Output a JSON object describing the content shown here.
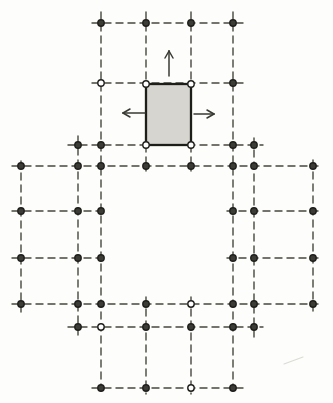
{
  "figure": {
    "kind": "structural-grid-plan",
    "canvas": {
      "width": 333,
      "height": 403,
      "background": "#fdfdfb"
    },
    "palette": {
      "grid_line": "#47473f",
      "node_fill": "#3c3c36",
      "node_open_fill": "#ffffff",
      "node_stroke": "#201f1c",
      "block_fill": "#d6d5d0",
      "block_stroke": "#1d1d1a",
      "arrow": "#3a3a34",
      "smudge": "#dcdbd5"
    },
    "line_style": {
      "width": 1.4,
      "dash": [
        7,
        5
      ]
    },
    "h_lines": [
      {
        "y": 23,
        "x1": 92,
        "x2": 243
      },
      {
        "y": 83,
        "x1": 92,
        "x2": 243
      },
      {
        "y": 145,
        "x1": 68,
        "x2": 263
      },
      {
        "y": 166,
        "x1": 12,
        "x2": 318
      },
      {
        "y": 211,
        "x1": 12,
        "x2": 107
      },
      {
        "y": 211,
        "x1": 227,
        "x2": 318
      },
      {
        "y": 258,
        "x1": 12,
        "x2": 107
      },
      {
        "y": 258,
        "x1": 227,
        "x2": 318
      },
      {
        "y": 304,
        "x1": 12,
        "x2": 318
      },
      {
        "y": 327,
        "x1": 68,
        "x2": 263
      },
      {
        "y": 388,
        "x1": 92,
        "x2": 243
      }
    ],
    "v_lines": [
      {
        "x": 21,
        "y1": 161,
        "y2": 314
      },
      {
        "x": 78,
        "y1": 136,
        "y2": 338
      },
      {
        "x": 101,
        "y1": 12,
        "y2": 394
      },
      {
        "x": 146,
        "y1": 12,
        "y2": 84
      },
      {
        "x": 146,
        "y1": 145,
        "y2": 171
      },
      {
        "x": 146,
        "y1": 297,
        "y2": 394
      },
      {
        "x": 191,
        "y1": 12,
        "y2": 84
      },
      {
        "x": 191,
        "y1": 145,
        "y2": 171
      },
      {
        "x": 191,
        "y1": 297,
        "y2": 394
      },
      {
        "x": 233,
        "y1": 12,
        "y2": 394
      },
      {
        "x": 254,
        "y1": 138,
        "y2": 338
      },
      {
        "x": 313,
        "y1": 160,
        "y2": 312
      }
    ],
    "nodes": [
      {
        "x": 101,
        "y": 23,
        "open": false
      },
      {
        "x": 146,
        "y": 23,
        "open": false
      },
      {
        "x": 191,
        "y": 23,
        "open": false
      },
      {
        "x": 233,
        "y": 23,
        "open": false
      },
      {
        "x": 101,
        "y": 83,
        "open": true
      },
      {
        "x": 233,
        "y": 83,
        "open": false
      },
      {
        "x": 78,
        "y": 145,
        "open": false
      },
      {
        "x": 101,
        "y": 145,
        "open": false
      },
      {
        "x": 233,
        "y": 145,
        "open": false
      },
      {
        "x": 254,
        "y": 145,
        "open": false
      },
      {
        "x": 21,
        "y": 166,
        "open": false
      },
      {
        "x": 78,
        "y": 166,
        "open": false
      },
      {
        "x": 101,
        "y": 166,
        "open": false
      },
      {
        "x": 146,
        "y": 166,
        "open": false
      },
      {
        "x": 191,
        "y": 166,
        "open": false
      },
      {
        "x": 233,
        "y": 166,
        "open": false
      },
      {
        "x": 254,
        "y": 166,
        "open": false
      },
      {
        "x": 313,
        "y": 166,
        "open": false
      },
      {
        "x": 21,
        "y": 211,
        "open": false
      },
      {
        "x": 78,
        "y": 211,
        "open": false
      },
      {
        "x": 101,
        "y": 211,
        "open": false
      },
      {
        "x": 233,
        "y": 211,
        "open": false
      },
      {
        "x": 254,
        "y": 211,
        "open": false
      },
      {
        "x": 313,
        "y": 211,
        "open": false
      },
      {
        "x": 21,
        "y": 258,
        "open": false
      },
      {
        "x": 78,
        "y": 258,
        "open": false
      },
      {
        "x": 101,
        "y": 258,
        "open": false
      },
      {
        "x": 233,
        "y": 258,
        "open": false
      },
      {
        "x": 254,
        "y": 258,
        "open": false
      },
      {
        "x": 313,
        "y": 258,
        "open": false
      },
      {
        "x": 21,
        "y": 304,
        "open": false
      },
      {
        "x": 78,
        "y": 304,
        "open": false
      },
      {
        "x": 101,
        "y": 304,
        "open": false
      },
      {
        "x": 146,
        "y": 304,
        "open": false
      },
      {
        "x": 191,
        "y": 304,
        "open": true
      },
      {
        "x": 233,
        "y": 304,
        "open": false
      },
      {
        "x": 254,
        "y": 304,
        "open": false
      },
      {
        "x": 313,
        "y": 304,
        "open": false
      },
      {
        "x": 78,
        "y": 327,
        "open": false
      },
      {
        "x": 101,
        "y": 327,
        "open": true
      },
      {
        "x": 146,
        "y": 327,
        "open": false
      },
      {
        "x": 191,
        "y": 327,
        "open": false
      },
      {
        "x": 233,
        "y": 327,
        "open": false
      },
      {
        "x": 254,
        "y": 327,
        "open": false
      },
      {
        "x": 101,
        "y": 388,
        "open": false
      },
      {
        "x": 146,
        "y": 388,
        "open": false
      },
      {
        "x": 191,
        "y": 388,
        "open": true
      },
      {
        "x": 233,
        "y": 388,
        "open": false
      }
    ],
    "node_style": {
      "radius": 3.2,
      "ring_width": 1.4
    },
    "block": {
      "x": 146,
      "y": 84,
      "width": 45,
      "height": 61,
      "border_width": 2.3,
      "corner_nodes": [
        {
          "x": 146,
          "y": 84
        },
        {
          "x": 191,
          "y": 84
        },
        {
          "x": 146,
          "y": 145
        },
        {
          "x": 191,
          "y": 145
        }
      ]
    },
    "arrows": [
      {
        "direction": "up",
        "x1": 169,
        "y1": 76,
        "x2": 169,
        "y2": 51
      },
      {
        "direction": "left",
        "x1": 145,
        "y1": 113,
        "x2": 123,
        "y2": 113
      },
      {
        "direction": "right",
        "x1": 194,
        "y1": 114,
        "x2": 214,
        "y2": 114
      }
    ],
    "arrow_style": {
      "width": 1.5,
      "head_length": 7,
      "head_half_width": 4
    },
    "smudge": {
      "x1": 284,
      "y1": 364,
      "x2": 303,
      "y2": 357,
      "width": 1.2
    }
  }
}
